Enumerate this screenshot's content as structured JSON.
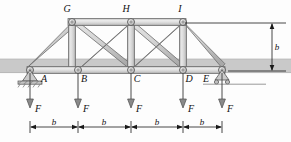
{
  "figure": {
    "type": "statics-truss-free-body-diagram",
    "colors": {
      "page_background": "#fdfdfd",
      "member_fill": "#d2d2d2",
      "member_fill_light": "#e6e6e6",
      "member_fill_dark": "#b4b4b4",
      "member_stroke": "#6d6d6d",
      "joint_fill": "#cfcfcf",
      "joint_stroke": "#5a5a5a",
      "deck_band": "#c9c9c9",
      "deck_band_edge": "#b0b0b0",
      "dimension_line": "#1a1a1a",
      "arrow_fill": "#8a8a8a",
      "arrow_stroke": "#4a4a4a",
      "text": "#111111",
      "support_fill": "#bdbdbd",
      "support_stroke": "#555555",
      "ground_line": "#8e8e8e"
    },
    "joints": {
      "bottom": [
        {
          "id": "A",
          "label": "A",
          "x": 30,
          "y": 70,
          "label_x": 44,
          "label_y": 82,
          "support": "pin"
        },
        {
          "id": "B",
          "label": "B",
          "x": 78,
          "y": 70,
          "label_x": 84,
          "label_y": 82,
          "support": "none"
        },
        {
          "id": "C",
          "label": "C",
          "x": 131,
          "y": 70,
          "label_x": 137,
          "label_y": 82,
          "support": "none"
        },
        {
          "id": "D",
          "label": "D",
          "x": 183,
          "y": 70,
          "label_x": 189,
          "label_y": 82,
          "support": "none"
        },
        {
          "id": "E",
          "label": "E",
          "x": 222,
          "y": 70,
          "label_x": 206,
          "label_y": 82,
          "support": "roller"
        }
      ],
      "top": [
        {
          "id": "G",
          "label": "G",
          "x": 72,
          "y": 22,
          "label_x": 67,
          "label_y": 12
        },
        {
          "id": "H",
          "label": "H",
          "x": 131,
          "y": 22,
          "label_x": 126,
          "label_y": 12
        },
        {
          "id": "I",
          "label": "I",
          "x": 183,
          "y": 22,
          "label_x": 180,
          "label_y": 12
        }
      ]
    },
    "members": [
      {
        "name": "bottom-chord-A-E",
        "from": "A",
        "to": "E",
        "kind": "chord"
      },
      {
        "name": "top-chord-G-I",
        "from": "G",
        "to": "I",
        "kind": "chord"
      },
      {
        "name": "end-post-A-G",
        "from": "A",
        "to": "G",
        "kind": "diagonal"
      },
      {
        "name": "end-post-I-E",
        "from": "I",
        "to": "E",
        "kind": "diagonal"
      },
      {
        "name": "vertical-B-G",
        "from": "B",
        "to": "G",
        "kind": "vertical"
      },
      {
        "name": "vertical-C-H",
        "from": "C",
        "to": "H",
        "kind": "vertical"
      },
      {
        "name": "vertical-D-I",
        "from": "D",
        "to": "I",
        "kind": "vertical"
      },
      {
        "name": "diagonal-G-C",
        "from": "G",
        "to": "C",
        "kind": "diagonal"
      },
      {
        "name": "diagonal-H-B",
        "from": "H",
        "to": "B",
        "kind": "diagonal"
      },
      {
        "name": "diagonal-H-D",
        "from": "H",
        "to": "D",
        "kind": "diagonal"
      },
      {
        "name": "diagonal-I-C",
        "from": "I",
        "to": "C",
        "kind": "diagonal"
      }
    ],
    "loads": [
      {
        "label": "F",
        "at_joint": "A",
        "x": 30,
        "label_x": 38,
        "label_y": 112,
        "direction": "down"
      },
      {
        "label": "F",
        "at_joint": "B",
        "x": 78,
        "label_x": 86,
        "label_y": 112,
        "direction": "down"
      },
      {
        "label": "F",
        "at_joint": "C",
        "x": 131,
        "label_x": 139,
        "label_y": 112,
        "direction": "down"
      },
      {
        "label": "F",
        "at_joint": "D",
        "x": 183,
        "label_x": 191,
        "label_y": 112,
        "direction": "down"
      },
      {
        "label": "F",
        "at_joint": "E",
        "x": 222,
        "label_x": 230,
        "label_y": 112,
        "direction": "down"
      }
    ],
    "dimensions": {
      "horizontal": [
        {
          "label": "b",
          "from_x": 30,
          "to_x": 78,
          "y": 127,
          "label_x": 54,
          "label_y": 125
        },
        {
          "label": "b",
          "from_x": 78,
          "to_x": 131,
          "y": 127,
          "label_x": 104,
          "label_y": 125
        },
        {
          "label": "b",
          "from_x": 131,
          "to_x": 183,
          "y": 127,
          "label_x": 157,
          "label_y": 125
        },
        {
          "label": "b",
          "from_x": 183,
          "to_x": 222,
          "y": 127,
          "label_x": 202,
          "label_y": 125
        }
      ],
      "vertical": [
        {
          "label": "b",
          "x": 272,
          "from_y": 23,
          "to_y": 71,
          "label_x": 276,
          "label_y": 50
        }
      ],
      "extension_lines": [
        {
          "name": "top-extension",
          "x1": 185,
          "y1": 23,
          "x2": 286,
          "y2": 23
        },
        {
          "name": "bottom-extension",
          "x1": 228,
          "y1": 71,
          "x2": 286,
          "y2": 71
        }
      ]
    },
    "deck": {
      "name": "deck-band",
      "x": 0,
      "y": 59,
      "width": 291,
      "height": 14
    },
    "ground_line": {
      "name": "ground-line",
      "x1": 203,
      "y1": 84,
      "x2": 266,
      "y2": 84
    }
  }
}
